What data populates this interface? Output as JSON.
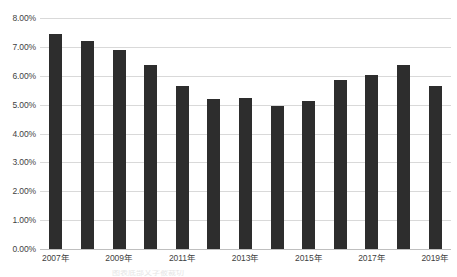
{
  "chart_data": {
    "type": "bar",
    "title": "",
    "xlabel": "",
    "ylabel": "",
    "categories": [
      "2007年",
      "2008年",
      "2009年",
      "2010年",
      "2011年",
      "2012年",
      "2013年",
      "2014年",
      "2015年",
      "2016年",
      "2017年",
      "2018年",
      "2019年"
    ],
    "values": [
      7.43,
      7.22,
      6.88,
      6.37,
      5.65,
      5.19,
      5.23,
      4.95,
      5.14,
      5.87,
      6.02,
      6.37,
      5.65
    ],
    "value_format": "percent",
    "ylim": [
      0,
      8
    ],
    "ytick_values": [
      0,
      1,
      2,
      3,
      4,
      5,
      6,
      7,
      8
    ],
    "ytick_labels": [
      "0.00%",
      "1.00%",
      "2.00%",
      "3.00%",
      "4.00%",
      "5.00%",
      "6.00%",
      "7.00%",
      "8.00%"
    ],
    "xtick_labels": [
      "2007年",
      "2009年",
      "2011年",
      "2013年",
      "2015年",
      "2017年",
      "2019年"
    ],
    "xtick_indices": [
      0,
      2,
      4,
      6,
      8,
      10,
      12
    ],
    "grid": true,
    "legend": false,
    "legend_position": "none",
    "series_color": "#2d2d2d",
    "gridline_color": "#d9d9d9",
    "background_color": "#ffffff"
  },
  "caption": {
    "clipped_text": "图表底部文字被裁切"
  }
}
